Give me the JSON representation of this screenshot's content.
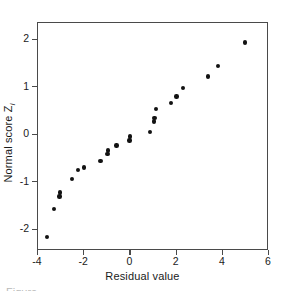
{
  "chart_data": {
    "type": "scatter",
    "title": "",
    "xlabel": "Residual value",
    "ylabel_text": "Normal score Z",
    "ylabel_subscript": "i",
    "xlim": [
      -4,
      6
    ],
    "ylim": [
      -2.45,
      2.35
    ],
    "xticks": [
      -4,
      -2,
      0,
      2,
      4,
      6
    ],
    "xticklabels": [
      "-4",
      "-2",
      "0",
      "2",
      "4",
      "6"
    ],
    "yticks": [
      -2,
      -1,
      0,
      1,
      2
    ],
    "yticklabels": [
      "-2",
      "-1",
      "0",
      "1",
      "2"
    ],
    "grid": false,
    "legend": "none",
    "marker": "filled-circle",
    "marker_color": "#121212",
    "frame_color": "#4a4a4a",
    "background": "#ffffff",
    "points": [
      {
        "x": -3.62,
        "y": -2.15
      },
      {
        "x": -3.3,
        "y": -1.57
      },
      {
        "x": -3.07,
        "y": -1.3
      },
      {
        "x": -3.05,
        "y": -1.22
      },
      {
        "x": -2.52,
        "y": -0.93
      },
      {
        "x": -2.28,
        "y": -0.75
      },
      {
        "x": -2.0,
        "y": -0.69
      },
      {
        "x": -1.3,
        "y": -0.55
      },
      {
        "x": -1.0,
        "y": -0.41
      },
      {
        "x": -0.97,
        "y": -0.33
      },
      {
        "x": -0.6,
        "y": -0.23
      },
      {
        "x": -0.04,
        "y": -0.12
      },
      {
        "x": -0.02,
        "y": -0.04
      },
      {
        "x": 0.85,
        "y": 0.06
      },
      {
        "x": 1.03,
        "y": 0.28
      },
      {
        "x": 1.05,
        "y": 0.35
      },
      {
        "x": 1.12,
        "y": 0.54
      },
      {
        "x": 1.75,
        "y": 0.67
      },
      {
        "x": 2.0,
        "y": 0.8
      },
      {
        "x": 2.28,
        "y": 0.98
      },
      {
        "x": 3.35,
        "y": 1.22
      },
      {
        "x": 3.8,
        "y": 1.45
      },
      {
        "x": 4.97,
        "y": 1.94
      }
    ]
  },
  "caption": {
    "partial_text": "Figure"
  }
}
